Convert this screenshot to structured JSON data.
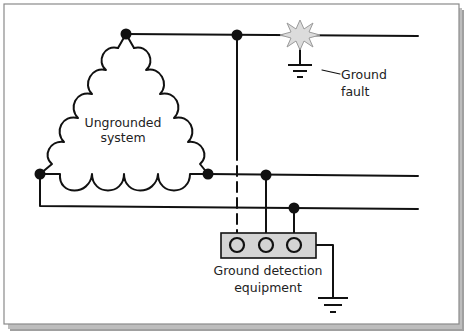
{
  "diagram": {
    "labels": {
      "system_line1": "Ungrounded",
      "system_line2": "system",
      "fault_line1": "Ground",
      "fault_line2": "fault",
      "equipment_line1": "Ground detection",
      "equipment_line2": "equipment"
    },
    "components": [
      {
        "id": "ungrounded-delta-winding",
        "type": "delta-coil-system"
      },
      {
        "id": "ground-fault",
        "type": "starburst-fault",
        "color": "#dcdcdc"
      },
      {
        "id": "fault-ground",
        "type": "ground-symbol"
      },
      {
        "id": "ground-detection-box",
        "type": "detection-equipment",
        "indicators": 3,
        "color": "#d4d4d4"
      },
      {
        "id": "equipment-ground",
        "type": "ground-symbol"
      }
    ],
    "conductors": [
      {
        "id": "phase-a",
        "from": "top-node",
        "to": "right-edge"
      },
      {
        "id": "phase-b",
        "from": "bottom-right-node",
        "to": "right-edge"
      },
      {
        "id": "phase-c",
        "from": "bottom-left-node",
        "to": "right-edge"
      }
    ],
    "colors": {
      "line": "#111111",
      "frame_border": "#8a8a8a",
      "shadow": "#9a9a9a",
      "starburst_fill": "#dcdcdc",
      "box_fill": "#d4d4d4"
    }
  }
}
